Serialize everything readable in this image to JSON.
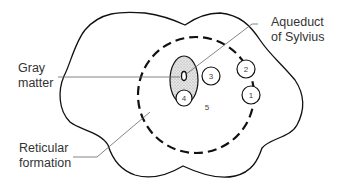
{
  "diagram": {
    "labels": {
      "gray_matter": [
        "Gray",
        "matter"
      ],
      "aqueduct": [
        "Aqueduct",
        "of Sylvius"
      ],
      "reticular": [
        "Reticular",
        "formation"
      ]
    },
    "nuclei": [
      {
        "id": "1",
        "label": "1"
      },
      {
        "id": "2",
        "label": "2"
      },
      {
        "id": "3",
        "label": "3"
      },
      {
        "id": "4",
        "label": "4"
      },
      {
        "id": "5",
        "label": "5"
      }
    ],
    "colors": {
      "line": "#111111",
      "leader": "#555555",
      "gray_fill": "#d8d8d8",
      "text": "#333333"
    }
  }
}
